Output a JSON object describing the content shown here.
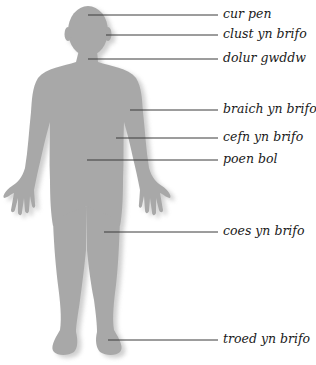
{
  "diagram": {
    "colors": {
      "body": "#a8a8a8",
      "shadow": "#6f6f6f",
      "leader_line": "#3a3a3a",
      "text": "#1a1a1a"
    },
    "labels": [
      {
        "id": "head",
        "text": "cur pen"
      },
      {
        "id": "ear",
        "text": "clust yn brifo"
      },
      {
        "id": "throat",
        "text": "dolur gwddw"
      },
      {
        "id": "arm",
        "text": "braich yn brifo"
      },
      {
        "id": "back",
        "text": "cefn yn brifo"
      },
      {
        "id": "stomach",
        "text": "poen bol"
      },
      {
        "id": "leg",
        "text": "coes yn brifo"
      },
      {
        "id": "foot",
        "text": "troed yn brifo"
      }
    ]
  }
}
